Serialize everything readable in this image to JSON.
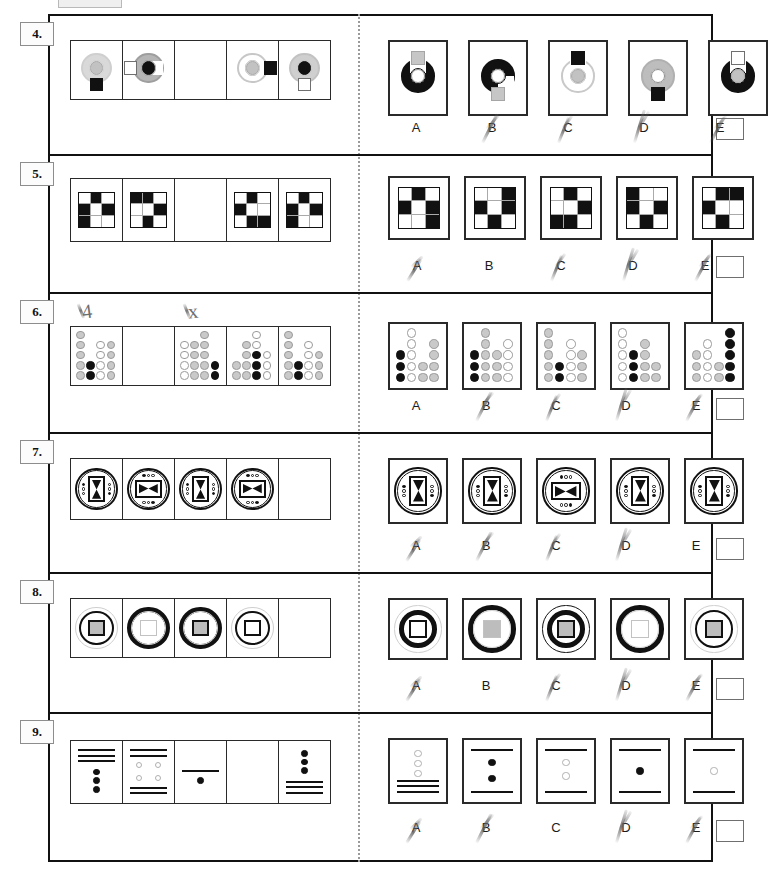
{
  "page": {
    "answer_letters": [
      "A",
      "B",
      "C",
      "D",
      "E"
    ],
    "marks": {
      "row6_note_left": "4",
      "row6_note_right": "x"
    }
  },
  "rows": [
    {
      "number": "4.",
      "puzzle_type": "ring-with-square",
      "blank_index": 2,
      "sequence": [
        {
          "ring": "light-gray-partial",
          "inner": "gray-circle",
          "block": "black-square-bottom"
        },
        {
          "ring": "gray-c-shape",
          "inner": "black-circle",
          "block": "white-square-left"
        },
        {
          "blank": true
        },
        {
          "ring": "white-outline-c",
          "inner": "gray-circle",
          "block": "black-square-right"
        },
        {
          "ring": "light-gray-full",
          "inner": "black-circle",
          "block": "white-square-bottom"
        }
      ],
      "options": [
        {
          "letter": "A",
          "ring": "black-u-shape",
          "inner": "white-circle",
          "block": "gray-square-top"
        },
        {
          "letter": "B",
          "ring": "black-c-shape",
          "inner": "white-circle",
          "block": "gray-square-bottom"
        },
        {
          "letter": "C",
          "ring": "white-u-outline",
          "inner": "gray-circle",
          "block": "black-square-top"
        },
        {
          "letter": "D",
          "ring": "gray-full",
          "inner": "white-circle",
          "block": "black-square-bottom"
        },
        {
          "letter": "E",
          "ring": "black-u-shape",
          "inner": "gray-circle",
          "block": "white-square-top"
        }
      ],
      "struck_letters": [
        "B",
        "C",
        "D",
        "E"
      ]
    },
    {
      "number": "5.",
      "puzzle_type": "3x3-black-white-grid",
      "blank_index": 2,
      "sequence": [
        {
          "cells": [
            "w",
            "k",
            "w",
            "k",
            "w",
            "k",
            "k",
            "w",
            "w"
          ]
        },
        {
          "cells": [
            "k",
            "k",
            "w",
            "w",
            "w",
            "k",
            "w",
            "k",
            "w"
          ]
        },
        {
          "blank": true
        },
        {
          "cells": [
            "w",
            "k",
            "w",
            "k",
            "w",
            "w",
            "w",
            "k",
            "k"
          ]
        },
        {
          "cells": [
            "w",
            "k",
            "w",
            "k",
            "w",
            "k",
            "k",
            "w",
            "w"
          ]
        }
      ],
      "options": [
        {
          "letter": "A",
          "cells": [
            "w",
            "k",
            "w",
            "k",
            "w",
            "k",
            "w",
            "w",
            "k"
          ]
        },
        {
          "letter": "B",
          "cells": [
            "w",
            "w",
            "k",
            "k",
            "w",
            "k",
            "w",
            "k",
            "w"
          ]
        },
        {
          "letter": "C",
          "cells": [
            "w",
            "k",
            "w",
            "w",
            "w",
            "k",
            "k",
            "k",
            "w"
          ]
        },
        {
          "letter": "D",
          "cells": [
            "k",
            "w",
            "w",
            "k",
            "w",
            "k",
            "w",
            "k",
            "w"
          ]
        },
        {
          "letter": "E",
          "cells": [
            "w",
            "k",
            "k",
            "k",
            "w",
            "w",
            "w",
            "k",
            "w"
          ]
        }
      ],
      "struck_letters": [
        "A",
        "C",
        "D",
        "E"
      ]
    },
    {
      "number": "6.",
      "puzzle_type": "dot-matrix",
      "blank_index": 1,
      "sequence": [
        {
          "label": "cell-1"
        },
        {
          "blank": true
        },
        {
          "label": "cell-3"
        },
        {
          "label": "cell-4"
        },
        {
          "label": "cell-5"
        }
      ],
      "options": [
        {
          "letter": "A"
        },
        {
          "letter": "B"
        },
        {
          "letter": "C"
        },
        {
          "letter": "D"
        },
        {
          "letter": "E"
        }
      ],
      "struck_letters": [
        "B",
        "C",
        "D",
        "E"
      ]
    },
    {
      "number": "7.",
      "puzzle_type": "circle-bowtie-dots",
      "blank_index": 4,
      "sequence": [
        {
          "bowtie": "vertical",
          "dots": "left-and-right"
        },
        {
          "bowtie": "horizontal",
          "dots": "top-and-bottom"
        },
        {
          "bowtie": "vertical",
          "dots": "left-and-right"
        },
        {
          "bowtie": "horizontal",
          "dots": "top-and-bottom"
        },
        {
          "blank": true
        }
      ],
      "options": [
        {
          "letter": "A",
          "bowtie": "vertical",
          "dots": "left-and-right"
        },
        {
          "letter": "B",
          "bowtie": "vertical",
          "dots": "left-and-right"
        },
        {
          "letter": "C",
          "bowtie": "horizontal",
          "dots": "top-and-bottom"
        },
        {
          "letter": "D",
          "bowtie": "vertical",
          "dots": "left-and-right"
        },
        {
          "letter": "E",
          "bowtie": "vertical",
          "dots": "left-and-right"
        }
      ],
      "struck_letters": [
        "A",
        "B",
        "C",
        "D"
      ]
    },
    {
      "number": "8.",
      "puzzle_type": "concentric-circle-square",
      "blank_index": 4,
      "sequence": [
        {
          "outer": "thin-gray",
          "mid": "thin-black",
          "square": "gray-fill-black-border"
        },
        {
          "outer": "thick-black",
          "mid": "thin-gray",
          "square": "white-fill-gray-border"
        },
        {
          "outer": "thick-black",
          "mid": "thin-gray",
          "square": "gray-fill-black-border"
        },
        {
          "outer": "thin-gray",
          "mid": "thin-black",
          "square": "white-fill-black-border"
        },
        {
          "blank": true
        }
      ],
      "options": [
        {
          "letter": "A",
          "outer": "thin-gray",
          "mid": "thick-black",
          "square": "white-fill-black-border"
        },
        {
          "letter": "B",
          "outer": "thick-black",
          "mid": "thin-gray",
          "square": "gray-fill-gray-border"
        },
        {
          "letter": "C",
          "outer": "thin-black",
          "mid": "thick-black",
          "square": "gray-fill-black-border"
        },
        {
          "letter": "D",
          "outer": "thick-black",
          "mid": "thin-gray",
          "square": "white-fill-gray-border"
        },
        {
          "letter": "E",
          "outer": "thin-gray",
          "mid": "thin-black",
          "square": "gray-fill-black-border"
        }
      ],
      "struck_letters": [
        "A",
        "C",
        "D",
        "E"
      ]
    },
    {
      "number": "9.",
      "puzzle_type": "lines-and-dots",
      "blank_index": 3,
      "sequence": [
        {
          "lines": "three-top",
          "dots": "three-black-vertical"
        },
        {
          "lines": "two-top-two-bottom",
          "dots": "four-white-2x2"
        },
        {
          "lines": "one-middle",
          "dots": "one-black"
        },
        {
          "blank": true
        },
        {
          "lines": "three-bottom",
          "dots": "three-black-vertical"
        }
      ],
      "options": [
        {
          "letter": "A",
          "lines": "three-bottom",
          "dots": "three-white-vertical"
        },
        {
          "letter": "B",
          "lines": "one-top-one-bottom",
          "dots": "two-black-vertical"
        },
        {
          "letter": "C",
          "lines": "one-top-one-bottom",
          "dots": "two-white-vertical"
        },
        {
          "letter": "D",
          "lines": "one-top-one-bottom",
          "dots": "one-black"
        },
        {
          "letter": "E",
          "lines": "one-top-one-bottom",
          "dots": "one-white"
        }
      ],
      "struck_letters": [
        "A",
        "B",
        "D",
        "E"
      ]
    }
  ]
}
